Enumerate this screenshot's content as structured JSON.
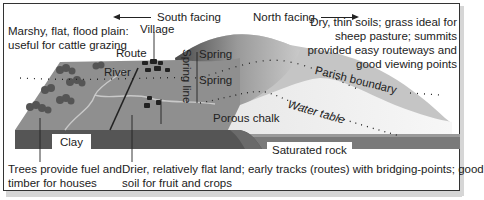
{
  "diagram": {
    "direction_labels": {
      "south": "South facing",
      "north": "North facing"
    },
    "annotations": {
      "flood_plain": [
        "Marshy, flat, flood plain:",
        "useful for cattle grazing"
      ],
      "dry_soils": [
        "Dry, thin soils; grass ideal for",
        "sheep pasture; summits",
        "provided easy routeways and",
        "good viewing points"
      ],
      "trees": [
        "Trees provide fuel and",
        "timber for houses"
      ],
      "drier_land": [
        "Drier, relatively flat land; early tracks (routes) with bridging-points; good",
        "soil for fruit and crops"
      ]
    },
    "features": {
      "village": "Village",
      "route": "Route",
      "river": "River",
      "spring_upper": "Spring",
      "spring_lower": "Spring",
      "spring_line": "Spring line",
      "parish_boundary": "Parish boundary",
      "water_table": "Water table",
      "porous_chalk": "Porous chalk",
      "clay": "Clay",
      "saturated_rock": "Saturated rock"
    },
    "colors": {
      "clay_surface": "#8c8c8c",
      "clay_front": "#555555",
      "chalk": "#f2f2f2",
      "hill_top": "#c8c8c8",
      "saturated_rock": "#7a7a7a",
      "border": "#333333"
    }
  }
}
